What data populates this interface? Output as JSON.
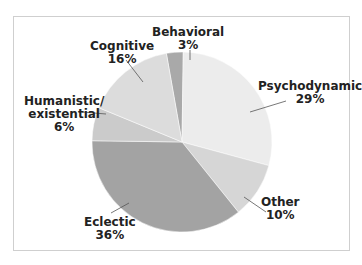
{
  "chart_data": {
    "type": "pie",
    "title": "",
    "slices": [
      {
        "label": "Behavioral",
        "value": 3,
        "display": "3%",
        "color": "#a9a9a9"
      },
      {
        "label": "Psychodynamic",
        "value": 29,
        "display": "29%",
        "color": "#ececec"
      },
      {
        "label": "Other",
        "value": 10,
        "display": "10%",
        "color": "#d6d6d6"
      },
      {
        "label": "Eclectic",
        "value": 36,
        "display": "36%",
        "color": "#a3a3a3"
      },
      {
        "label": "Humanistic/ existential",
        "value": 6,
        "display": "6%",
        "color": "#cbcbcb"
      },
      {
        "label": "Cognitive",
        "value": 16,
        "display": "16%",
        "color": "#dcdcdc"
      }
    ],
    "legend": "none (callout labels)",
    "start_angle_deg": -10
  },
  "labels": {
    "behavioral": {
      "name": "Behavioral",
      "pct": "3%"
    },
    "psychodynamic": {
      "name": "Psychodynamic",
      "pct": "29%"
    },
    "other": {
      "name": "Other",
      "pct": "10%"
    },
    "eclectic": {
      "name": "Eclectic",
      "pct": "36%"
    },
    "humanistic": {
      "name1": "Humanistic/",
      "name2": "existential",
      "pct": "6%"
    },
    "cognitive": {
      "name": "Cognitive",
      "pct": "16%"
    }
  }
}
